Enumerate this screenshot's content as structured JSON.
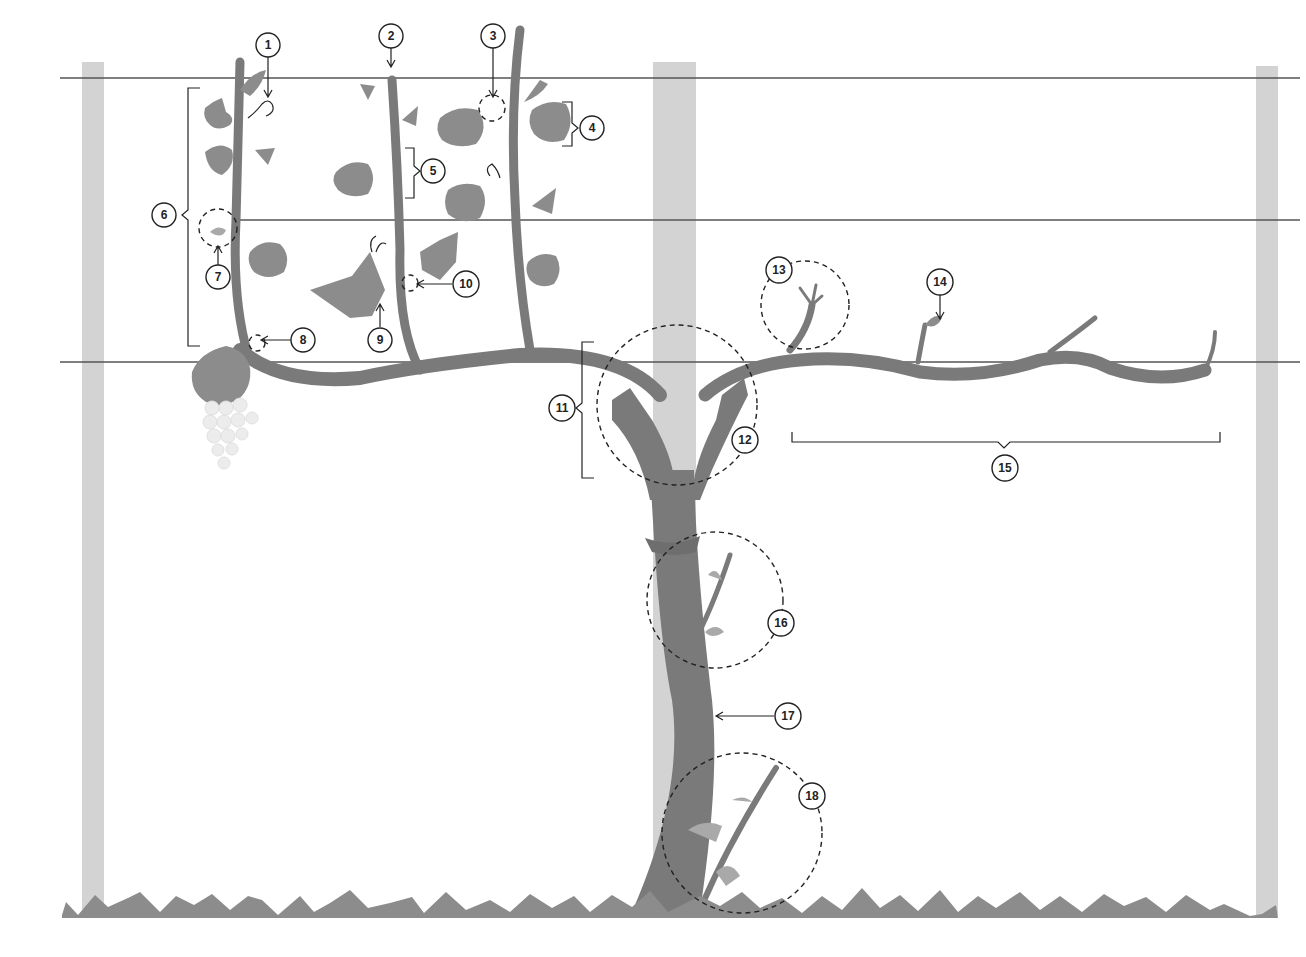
{
  "figure": {
    "title_fragment": ""
  },
  "colors": {
    "background": "#ffffff",
    "post": "#d3d3d3",
    "vine": "#7a7a7a",
    "leaf": "#8c8c8c",
    "leaf_light": "#a9a9a9",
    "wire": "#555555",
    "grape": "#ececec",
    "callout_stroke": "#222222"
  },
  "trellis": {
    "posts": [
      {
        "x": 82,
        "width": 22,
        "top": 62,
        "bottom": 915
      },
      {
        "x": 653,
        "width": 43,
        "top": 62,
        "bottom": 915
      },
      {
        "x": 1256,
        "width": 22,
        "top": 66,
        "bottom": 915
      }
    ],
    "wires_y": [
      78,
      220,
      362
    ]
  },
  "callouts": [
    {
      "n": "1",
      "x": 264,
      "y": 45
    },
    {
      "n": "2",
      "x": 387,
      "y": 36
    },
    {
      "n": "3",
      "x": 490,
      "y": 36
    },
    {
      "n": "4",
      "x": 592,
      "y": 128
    },
    {
      "n": "5",
      "x": 433,
      "y": 171
    },
    {
      "n": "6",
      "x": 164,
      "y": 215
    },
    {
      "n": "7",
      "x": 218,
      "y": 277
    },
    {
      "n": "8",
      "x": 305,
      "y": 340
    },
    {
      "n": "9",
      "x": 380,
      "y": 340
    },
    {
      "n": "10",
      "x": 466,
      "y": 284
    },
    {
      "n": "11",
      "x": 562,
      "y": 408
    },
    {
      "n": "12",
      "x": 743,
      "y": 440
    },
    {
      "n": "13",
      "x": 779,
      "y": 270
    },
    {
      "n": "14",
      "x": 940,
      "y": 282
    },
    {
      "n": "15",
      "x": 1005,
      "y": 468
    },
    {
      "n": "16",
      "x": 781,
      "y": 623
    },
    {
      "n": "17",
      "x": 788,
      "y": 716
    },
    {
      "n": "18",
      "x": 812,
      "y": 796
    }
  ]
}
